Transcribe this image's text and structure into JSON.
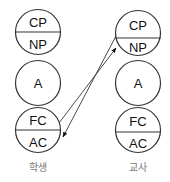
{
  "diagram": {
    "type": "transactional-analysis-ego-states",
    "colors": {
      "stroke": "#333333",
      "text": "#111111",
      "caption": "#777777",
      "background": "#ffffff"
    },
    "columns": [
      {
        "id": "student",
        "caption": "학생",
        "states": [
          {
            "kind": "split",
            "top": "CP",
            "bottom": "NP"
          },
          {
            "kind": "single",
            "label": "A"
          },
          {
            "kind": "split",
            "top": "FC",
            "bottom": "AC"
          }
        ]
      },
      {
        "id": "teacher",
        "caption": "교사",
        "states": [
          {
            "kind": "split",
            "top": "CP",
            "bottom": "NP"
          },
          {
            "kind": "single",
            "label": "A"
          },
          {
            "kind": "split",
            "top": "FC",
            "bottom": "AC"
          }
        ]
      }
    ],
    "transactions": [
      {
        "from": "student.FC",
        "to": "teacher.NP"
      },
      {
        "from": "teacher.CP",
        "to": "student.AC"
      }
    ]
  }
}
